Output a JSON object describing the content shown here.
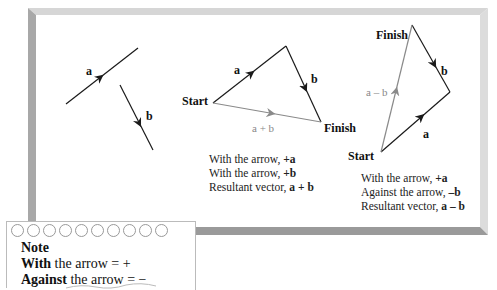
{
  "figure": {
    "panel1": {
      "vectors": [
        {
          "name": "a",
          "label": "a"
        },
        {
          "name": "b",
          "label": "b"
        }
      ]
    },
    "panel2": {
      "start_label": "Start",
      "finish_label": "Finish",
      "vector_a_label": "a",
      "vector_b_label": "b",
      "resultant_label": "a + b",
      "caption": [
        {
          "prefix": "With the arrow, ",
          "value": "+a"
        },
        {
          "prefix": "With the arrow, ",
          "value": "+b"
        },
        {
          "prefix": "Resultant vector, ",
          "value": "a + b"
        }
      ]
    },
    "panel3": {
      "start_label": "Start",
      "finish_label": "Finish",
      "vector_a_label": "a",
      "vector_b_label": "b",
      "resultant_label": "a – b",
      "caption": [
        {
          "prefix": "With the arrow, ",
          "value": "+a"
        },
        {
          "prefix": "Against the arrow, ",
          "value": "–b"
        },
        {
          "prefix": "Resultant vector, ",
          "value": "a – b"
        }
      ]
    },
    "note": {
      "title": "Note",
      "lines": [
        {
          "bold": "With",
          "rest": " the arrow = +"
        },
        {
          "bold": "Against",
          "rest": " the arrow = −"
        }
      ],
      "hole_count": 10
    },
    "colors": {
      "vector": "#1a1a1a",
      "resultant": "#8a8a8a",
      "frame_left": "#a8a8a8",
      "frame_top": "#d6d6d6",
      "frame_right": "#dcdcdc",
      "frame_bottom": "#9a9a9a"
    }
  }
}
